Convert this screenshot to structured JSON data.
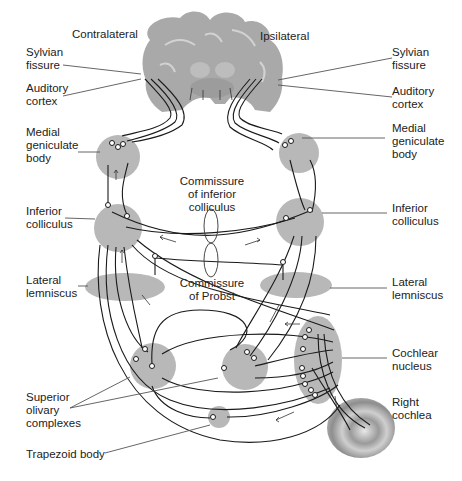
{
  "sides": {
    "contralateral": "Contralateral",
    "ipsilateral": "Ipsilateral"
  },
  "labels": {
    "left": {
      "sylvian_fissure": "Sylvian\nfissure",
      "auditory_cortex": "Auditory\ncortex",
      "medial_geniculate_body": "Medial\ngeniculate\nbody",
      "inferior_colliculus": "Inferior\ncolliculus",
      "lateral_lemniscus": "Lateral\nlemniscus",
      "superior_olivary_complexes": "Superior\nolivary\ncomplexes",
      "trapezoid_body": "Trapezoid body"
    },
    "right": {
      "sylvian_fissure": "Sylvian\nfissure",
      "auditory_cortex": "Auditory\ncortex",
      "medial_geniculate_body": "Medial\ngeniculate\nbody",
      "inferior_colliculus": "Inferior\ncolliculus",
      "lateral_lemniscus": "Lateral\nlemniscus",
      "cochlear_nucleus": "Cochlear\nnucleus",
      "right_cochlea": "Right\ncochlea"
    },
    "center": {
      "commissure_inferior_colliculus": "Commissure\nof inferior\ncolliculus",
      "commissure_probst": "Commissure\nof Probst"
    }
  },
  "colors": {
    "nucleus": "#b8b8b8",
    "brain": "#a9a9a9",
    "fiber": "#1a1a1a",
    "leader": "#555555",
    "text": "#222222"
  }
}
